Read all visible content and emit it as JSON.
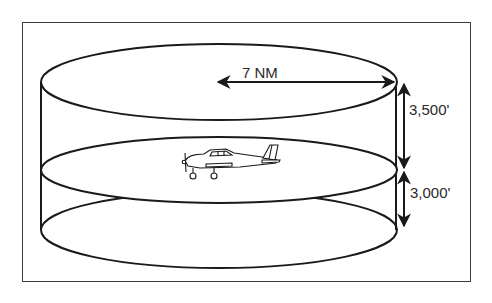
{
  "diagram": {
    "labels": {
      "radius": "7 NM",
      "upper_height": "3,500'",
      "lower_height": "3,000'"
    },
    "colors": {
      "line": "#1a1a1a",
      "background": "#ffffff",
      "frame": "#3a3a3a"
    }
  }
}
